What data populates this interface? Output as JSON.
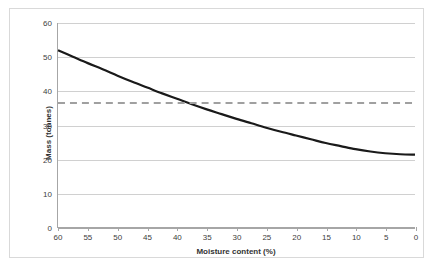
{
  "chart_data": {
    "type": "line",
    "title": "",
    "xlabel": "Moisture content (%)",
    "ylabel": "Mass (tonnes)",
    "xlim": [
      60,
      0
    ],
    "ylim": [
      0,
      60
    ],
    "x_tick_labels": [
      "60",
      "55",
      "50",
      "45",
      "40",
      "35",
      "30",
      "25",
      "20",
      "15",
      "10",
      "5",
      "0"
    ],
    "y_tick_labels": [
      "0",
      "10",
      "20",
      "30",
      "40",
      "50",
      "60"
    ],
    "x_ticks": [
      60,
      55,
      50,
      45,
      40,
      35,
      30,
      25,
      20,
      15,
      10,
      5,
      0
    ],
    "y_ticks": [
      0,
      10,
      20,
      30,
      40,
      50,
      60
    ],
    "x_axis_direction": "descending",
    "grid": "horizontal",
    "legend": "none",
    "series": [
      {
        "name": "Mass",
        "style": "solid",
        "color": "#1a1a1a",
        "width": 2.2,
        "x": [
          60,
          57.5,
          55,
          52.5,
          50,
          47.5,
          45,
          42.5,
          40,
          37.5,
          35,
          32.5,
          30,
          27.5,
          25,
          22.5,
          20,
          17.5,
          15,
          12.5,
          10,
          7.5,
          5,
          2.5,
          0
        ],
        "y": [
          52.0,
          50.1,
          48.2,
          46.4,
          44.5,
          42.7,
          41.0,
          39.3,
          37.7,
          36.1,
          34.6,
          33.2,
          31.8,
          30.5,
          29.2,
          28.0,
          26.9,
          25.8,
          24.7,
          23.8,
          22.9,
          22.2,
          21.7,
          21.4,
          21.3
        ]
      },
      {
        "name": "Reference mass",
        "style": "dashed",
        "color": "#a0a0a0",
        "width": 2.0,
        "constant_y": 36.5,
        "x": [
          60,
          0
        ],
        "y": [
          36.5,
          36.5
        ]
      }
    ],
    "annotations": [
      {
        "text": "",
        "note": "Dashed grey horizontal reference line at 36.5 tonnes intersects the curve near 42% moisture content"
      }
    ]
  },
  "figure": {
    "border_color": "#d9d9d9",
    "background": "#ffffff",
    "grid_color": "#d0d0d0",
    "axis_color": "#a6a6a6"
  }
}
